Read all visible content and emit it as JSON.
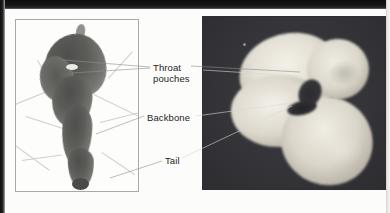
{
  "figure": {
    "kind": "embryo-comparison-photographs",
    "panels": [
      {
        "id": "left-panel",
        "name": "light-background-embryo-photo",
        "background_tone": "light",
        "subject_tone": "dark",
        "background_hex": "#fdfdfc",
        "subject_hex": "#5c5c59",
        "border_hex": "#a9a9a7"
      },
      {
        "id": "right-panel",
        "name": "dark-background-embryo-photo",
        "background_tone": "dark",
        "subject_tone": "pale",
        "background_hex": "#35353a",
        "subject_hex": "#e4e0d5"
      }
    ]
  },
  "labels": [
    {
      "id": "throat-pouches",
      "text": "Throat\npouches",
      "lines": [
        "Throat",
        "pouches"
      ],
      "color": "#242424"
    },
    {
      "id": "backbone",
      "text": "Backbone",
      "lines": [
        "Backbone"
      ],
      "color": "#242424"
    },
    {
      "id": "tail",
      "text": "Tail",
      "lines": [
        "Tail"
      ],
      "color": "#242424"
    }
  ],
  "leader_lines": {
    "left_color": "#8e8e8c",
    "right_color": "#d9d9d6",
    "count": 6
  },
  "scan_artifacts": {
    "top_edge_hex": "#141414",
    "left_edge_hex": "#1c1c1c",
    "page_hex": "#fcfcfb"
  }
}
